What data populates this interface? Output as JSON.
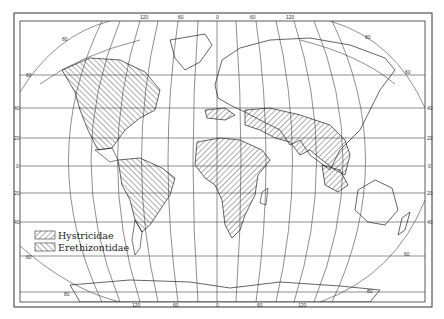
{
  "map": {
    "projection": "world, curved meridians (Van der Grinten-like)",
    "longitude_labels_top": [
      "120",
      "60",
      "0",
      "60",
      "120"
    ],
    "longitude_labels_bottom": [
      "120",
      "60",
      "0",
      "60",
      "120"
    ],
    "latitude_labels_left": [
      "40",
      "20",
      "0",
      "20",
      "40"
    ],
    "latitude_labels_right": [
      "40",
      "20",
      "0",
      "20",
      "40"
    ],
    "meridian_curve_labels": [
      "80",
      "60",
      "80",
      "60",
      "60",
      "80",
      "60",
      "80"
    ]
  },
  "legend": {
    "items": [
      {
        "label": "Hystricidae",
        "pattern": "hatch-forward"
      },
      {
        "label": "Erethizontidae",
        "pattern": "hatch-backward"
      }
    ]
  },
  "colors": {
    "ink": "#222222",
    "background": "#ffffff",
    "grid": "#444444"
  }
}
